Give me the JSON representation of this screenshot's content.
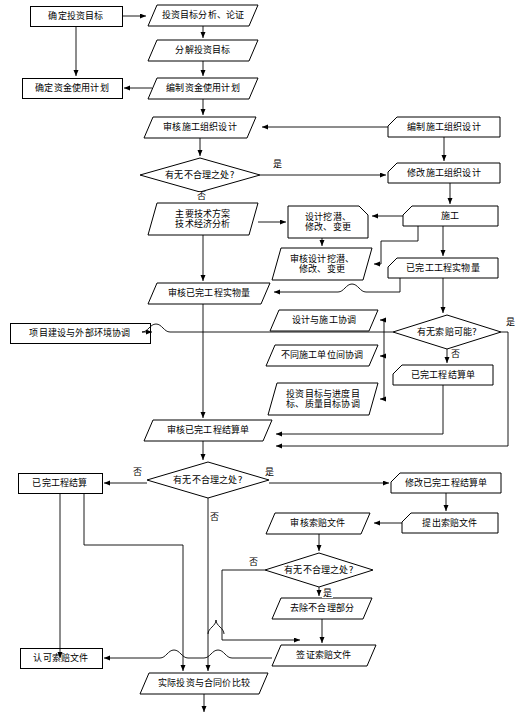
{
  "diagram": {
    "type": "flowchart",
    "width": 515,
    "height": 727,
    "stroke_color": "#000000",
    "fill_color": "#ffffff",
    "text_color": "#000000"
  },
  "nodes": [
    {
      "id": "n1",
      "label": "确定投资目标",
      "shape": "rect",
      "x": 30,
      "y": 6,
      "w": 92,
      "h": 20
    },
    {
      "id": "n2",
      "label": "投资目标分析、论证",
      "shape": "parallel",
      "x": 148,
      "y": 5,
      "w": 110,
      "h": 21
    },
    {
      "id": "n3",
      "label": "分解投资目标",
      "shape": "parallel",
      "x": 148,
      "y": 40,
      "w": 110,
      "h": 21
    },
    {
      "id": "n4",
      "label": "确定资金使用计划",
      "shape": "rect",
      "x": 22,
      "y": 78,
      "w": 100,
      "h": 20
    },
    {
      "id": "n5",
      "label": "编制资金使用计划",
      "shape": "parallel",
      "x": 148,
      "y": 78,
      "w": 110,
      "h": 21
    },
    {
      "id": "n6",
      "label": "审核施工组织设计",
      "shape": "parallel",
      "x": 144,
      "y": 117,
      "w": 112,
      "h": 21
    },
    {
      "id": "n7",
      "label": "编制施工组织设计",
      "shape": "chamfer-tl",
      "x": 388,
      "y": 117,
      "w": 112,
      "h": 20
    },
    {
      "id": "n8",
      "label": "有无不合理之处?",
      "shape": "diamond",
      "x": 140,
      "y": 158,
      "w": 120,
      "h": 34
    },
    {
      "id": "n9",
      "label": "修改施工组织设计",
      "shape": "chamfer-tl",
      "x": 388,
      "y": 163,
      "w": 112,
      "h": 20
    },
    {
      "id": "n10",
      "label": "主要技术方案\n技术经济分析",
      "shape": "parallel",
      "x": 148,
      "y": 203,
      "w": 110,
      "h": 32
    },
    {
      "id": "n11",
      "label": "设计挖潜、\n修改、变更",
      "shape": "chamfer-tr",
      "x": 288,
      "y": 206,
      "w": 80,
      "h": 32
    },
    {
      "id": "n12",
      "label": "施工",
      "shape": "chamfer-tl",
      "x": 403,
      "y": 206,
      "w": 95,
      "h": 20
    },
    {
      "id": "n13",
      "label": "审核设计挖潜、\n修改、变更",
      "shape": "parallel",
      "x": 272,
      "y": 248,
      "w": 100,
      "h": 32
    },
    {
      "id": "n14",
      "label": "已完工工程实物量",
      "shape": "chamfer-tl",
      "x": 388,
      "y": 258,
      "w": 110,
      "h": 20
    },
    {
      "id": "n15",
      "label": "审核已完工程实物量",
      "shape": "parallel",
      "x": 148,
      "y": 283,
      "w": 122,
      "h": 21
    },
    {
      "id": "n16",
      "label": "设计与施工协调",
      "shape": "parallel",
      "x": 270,
      "y": 310,
      "w": 108,
      "h": 21
    },
    {
      "id": "n17",
      "label": "项目建设与外部环境协调",
      "shape": "rect",
      "x": 10,
      "y": 323,
      "w": 140,
      "h": 20
    },
    {
      "id": "n18",
      "label": "有无索赔可能?",
      "shape": "diamond",
      "x": 393,
      "y": 315,
      "w": 108,
      "h": 34
    },
    {
      "id": "n19",
      "label": "不同施工单位间协调",
      "shape": "parallel",
      "x": 266,
      "y": 345,
      "w": 112,
      "h": 21
    },
    {
      "id": "n20",
      "label": "已完工程结算单",
      "shape": "chamfer-tl",
      "x": 393,
      "y": 365,
      "w": 100,
      "h": 20
    },
    {
      "id": "n21",
      "label": "投资目标与进度目\n标、质量目标协调",
      "shape": "parallel",
      "x": 268,
      "y": 383,
      "w": 110,
      "h": 32
    },
    {
      "id": "n22",
      "label": "审核已完工程结算单",
      "shape": "parallel",
      "x": 144,
      "y": 420,
      "w": 128,
      "h": 21
    },
    {
      "id": "n23",
      "label": "有无不合理之处?",
      "shape": "diamond",
      "x": 147,
      "y": 462,
      "w": 122,
      "h": 36
    },
    {
      "id": "n24",
      "label": "已完工程结算",
      "shape": "rect",
      "x": 18,
      "y": 473,
      "w": 84,
      "h": 20
    },
    {
      "id": "n25",
      "label": "修改已完工程结算单",
      "shape": "chamfer-tl",
      "x": 391,
      "y": 473,
      "w": 110,
      "h": 20
    },
    {
      "id": "n26",
      "label": "审核索赔文件",
      "shape": "parallel",
      "x": 266,
      "y": 513,
      "w": 104,
      "h": 21
    },
    {
      "id": "n27",
      "label": "提出索赔文件",
      "shape": "chamfer-tl",
      "x": 402,
      "y": 513,
      "w": 96,
      "h": 20
    },
    {
      "id": "n28",
      "label": "有无不合理之处?",
      "shape": "diamond",
      "x": 265,
      "y": 553,
      "w": 108,
      "h": 34
    },
    {
      "id": "n29",
      "label": "去除不合理部分",
      "shape": "parallel",
      "x": 272,
      "y": 598,
      "w": 100,
      "h": 21
    },
    {
      "id": "n30",
      "label": "认可索赔文件",
      "shape": "rect",
      "x": 20,
      "y": 648,
      "w": 82,
      "h": 20
    },
    {
      "id": "n31",
      "label": "签证索赔文件",
      "shape": "parallel",
      "x": 272,
      "y": 645,
      "w": 104,
      "h": 21
    },
    {
      "id": "n32",
      "label": "实际投资与合同价比较",
      "shape": "parallel",
      "x": 140,
      "y": 673,
      "w": 128,
      "h": 21
    }
  ],
  "edge_labels": [
    {
      "text": "是",
      "x": 272,
      "y": 160
    },
    {
      "text": "否",
      "x": 196,
      "y": 192
    },
    {
      "text": "是",
      "x": 505,
      "y": 318
    },
    {
      "text": "否",
      "x": 450,
      "y": 350
    },
    {
      "text": "否",
      "x": 132,
      "y": 468
    },
    {
      "text": "是",
      "x": 264,
      "y": 468
    },
    {
      "text": "否",
      "x": 209,
      "y": 513
    },
    {
      "text": "否",
      "x": 248,
      "y": 558
    },
    {
      "text": "是",
      "x": 322,
      "y": 589
    }
  ],
  "legend": {
    "rect": "矩形（业主/建设单位工作）",
    "parallel": "平行四边形（监理工作）",
    "diamond": "菱形（判断）",
    "chamfer": "切角矩形（承包单位工作）"
  }
}
